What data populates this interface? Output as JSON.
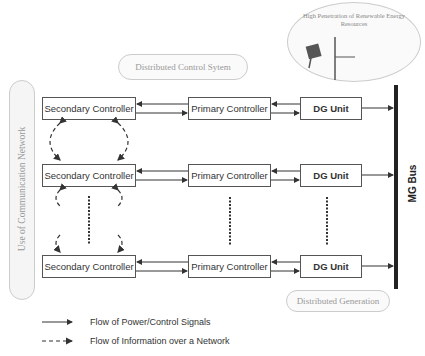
{
  "diagram": {
    "title_labels": {
      "distributed_control": "Distributed Control Sytem",
      "communication_network": "Use of Communication Network",
      "distributed_generation": "Distributed Generation",
      "renewable": "High Penetration of Renewable Energy Resources"
    },
    "rows": [
      {
        "secondary": "Secondary Controller",
        "primary": "Primary Controller",
        "dg": "DG Unit"
      },
      {
        "secondary": "Secondary Controller",
        "primary": "Primary Controller",
        "dg": "DG Unit"
      },
      {
        "secondary": "Secondary Controller",
        "primary": "Primary Controller",
        "dg": "DG Unit"
      }
    ],
    "bus_label": "MG Bus",
    "icons": [
      "solar-panel-icon",
      "wind-turbine-icon"
    ]
  },
  "legend": {
    "solid": "Flow of Power/Control Signals",
    "dashed": "Flow of Information over a Network"
  },
  "colors": {
    "line": "#333333",
    "pill_text": "#999999",
    "bus": "#222222"
  }
}
